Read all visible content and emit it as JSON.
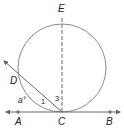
{
  "diagram": {
    "type": "geometry-circle-tangent-secant",
    "points": {
      "E": {
        "label": "E"
      },
      "D": {
        "label": "D"
      },
      "A": {
        "label": "A"
      },
      "C": {
        "label": "C"
      },
      "B": {
        "label": "B"
      }
    },
    "angle_labels": {
      "arc_measure": "a°",
      "angle_1": "1",
      "angle_3": "3"
    },
    "elements": [
      "circle",
      "tangent line AB at C",
      "secant ray from C through D",
      "dashed diameter EC"
    ],
    "colors": {
      "stroke": "#555555",
      "circle": "#888888",
      "text": "#222222",
      "point": "#777777"
    }
  }
}
